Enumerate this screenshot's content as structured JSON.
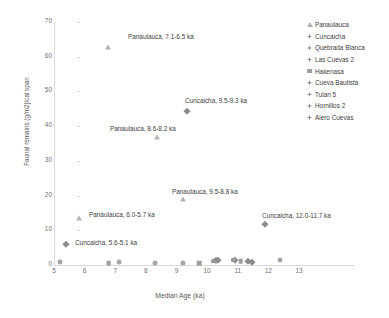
{
  "chart_data": {
    "type": "scatter",
    "title": "",
    "xlabel": "Median Age (ka)",
    "ylabel": "Faunal remains (g/m2)/cal span",
    "xlim": [
      5,
      13
    ],
    "ylim": [
      0,
      70
    ],
    "xticks": [
      "5",
      "6",
      "7",
      "8",
      "9",
      "10",
      "11",
      "12",
      "13"
    ],
    "yticks": [
      "0",
      "10",
      "20",
      "30",
      "40",
      "50",
      "60",
      "70"
    ],
    "grid": false,
    "legend_position": "upper-right",
    "colors": {
      "marker_light": "#b3b3b3",
      "marker_mid": "#9e9e9e",
      "marker_dark": "#8c8c8c",
      "axis": "#d9d9d9",
      "text": "#404040",
      "tick_text": "#6f6f6f"
    },
    "series": [
      {
        "name": "Panaulauca",
        "marker": "triangle",
        "points": [
          {
            "x": 6.75,
            "y": 62.8,
            "label": "Panaulauca, 7.1-6.5 ka"
          },
          {
            "x": 8.35,
            "y": 37.0,
            "label": "Panaulauca, 8.6-8.2 ka"
          },
          {
            "x": 9.2,
            "y": 18.9,
            "label": "Panaulauca, 9.5-8.8 ka"
          },
          {
            "x": 5.82,
            "y": 13.4,
            "label": "Panaulauca, 6.0-5.7 ka"
          }
        ]
      },
      {
        "name": "Cuncaicha",
        "marker": "diamond",
        "points": [
          {
            "x": 9.35,
            "y": 44.5,
            "label": "Cuncaicha, 9.5-9.3 ka"
          },
          {
            "x": 11.88,
            "y": 11.8,
            "label": "Cuncaicha, 12.0-11.7 ka"
          },
          {
            "x": 5.4,
            "y": 6.1,
            "label": "Cuncaicha, 5.6-5.1 ka"
          },
          {
            "x": 10.3,
            "y": 1.3,
            "label": ""
          },
          {
            "x": 11.35,
            "y": 1.2,
            "label": ""
          },
          {
            "x": 11.45,
            "y": 1.0,
            "label": ""
          }
        ]
      },
      {
        "name": "Quebrada Blanca",
        "marker": "diamond",
        "points": [
          {
            "x": 10.9,
            "y": 1.4,
            "label": ""
          }
        ]
      },
      {
        "name": "Las Cuevas  2",
        "marker": "diamond",
        "points": [
          {
            "x": 10.35,
            "y": 1.5,
            "label": ""
          }
        ]
      },
      {
        "name": "Hakenasa",
        "marker": "square",
        "points": [
          {
            "x": 6.78,
            "y": 0.5,
            "label": ""
          },
          {
            "x": 9.75,
            "y": 0.6,
            "label": ""
          },
          {
            "x": 11.1,
            "y": 1.1,
            "label": ""
          }
        ]
      },
      {
        "name": "Cueva Bautista",
        "marker": "circle",
        "points": [
          {
            "x": 5.2,
            "y": 0.9,
            "label": ""
          },
          {
            "x": 7.12,
            "y": 1.0,
            "label": ""
          }
        ]
      },
      {
        "name": "Tulan 5",
        "marker": "circle",
        "points": [
          {
            "x": 8.3,
            "y": 0.6,
            "label": ""
          },
          {
            "x": 9.2,
            "y": 0.6,
            "label": ""
          }
        ]
      },
      {
        "name": "Hornillos 2",
        "marker": "pentagon",
        "points": [
          {
            "x": 10.2,
            "y": 1.2,
            "label": ""
          },
          {
            "x": 10.85,
            "y": 1.5,
            "label": ""
          }
        ]
      },
      {
        "name": "Alero Cuevas",
        "marker": "circle",
        "points": [
          {
            "x": 12.38,
            "y": 1.3,
            "label": ""
          }
        ]
      }
    ],
    "annotations": [
      {
        "text": "Panaulauca, 7.1-6.5 ka",
        "x": 128,
        "y": 34
      },
      {
        "text": "Cuncaicha, 9.5-9.3 ka",
        "x": 185,
        "y": 98
      },
      {
        "text": "Panaulauca, 8.6-8.2 ka",
        "x": 110,
        "y": 126
      },
      {
        "text": "Panaulauca, 9.5-8.8 ka",
        "x": 172,
        "y": 189
      },
      {
        "text": "Panaulauca, 6.0-5.7 ka",
        "x": 89,
        "y": 212
      },
      {
        "text": "Cuncaicha, 12.0-11.7 ka",
        "x": 262,
        "y": 213
      },
      {
        "text": "Cuncaicha, 5.6-5.1 ka",
        "x": 75,
        "y": 240
      }
    ],
    "legend_items": [
      {
        "label": "Panaulauca",
        "marker": "triangle"
      },
      {
        "label": "Cuncaicha",
        "marker": "diamond4"
      },
      {
        "label": "Quebrada Blanca",
        "marker": "diamond4"
      },
      {
        "label": "Las Cuevas  2",
        "marker": "diamond4"
      },
      {
        "label": "Hakenasa",
        "marker": "square"
      },
      {
        "label": "Cueva Bautista",
        "marker": "diamond4"
      },
      {
        "label": "Tulan 5",
        "marker": "diamond4"
      },
      {
        "label": "Hornillos  2",
        "marker": "diamond4"
      },
      {
        "label": "Alero Cuevas",
        "marker": "diamond4"
      }
    ]
  }
}
